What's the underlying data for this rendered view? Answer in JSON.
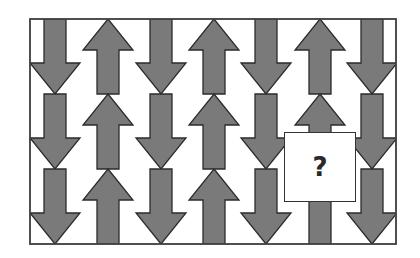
{
  "puzzle": {
    "type": "pattern-completion",
    "frame": {
      "x": 30,
      "y": 19,
      "width": 366,
      "height": 225
    },
    "arrow_fill": "#7a7a7a",
    "arrow_stroke": "#2b2b2b",
    "frame_stroke": "#444444",
    "columns": [
      {
        "index": 1,
        "direction": "down",
        "center_x": 55
      },
      {
        "index": 2,
        "direction": "up",
        "center_x": 108
      },
      {
        "index": 3,
        "direction": "down",
        "center_x": 161
      },
      {
        "index": 4,
        "direction": "up",
        "center_x": 214
      },
      {
        "index": 5,
        "direction": "down",
        "center_x": 266
      },
      {
        "index": 6,
        "direction": "up",
        "center_x": 320
      },
      {
        "index": 7,
        "direction": "down",
        "center_x": 372
      }
    ],
    "rows": 3,
    "missing_cell": {
      "column": 6,
      "row": 2,
      "label": "?"
    }
  }
}
